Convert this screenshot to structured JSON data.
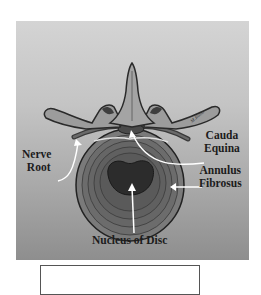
{
  "figure": {
    "type": "anatomical-diagram",
    "colors": {
      "background_top": "#d4d4d4",
      "background_bottom": "#8e8e8e",
      "bone": "#9a9a9a",
      "outline": "#2a2a2a",
      "disc_ring": "#6e6e6e",
      "nucleus": "#2e2e2e",
      "arrow": "#ffffff",
      "label_text": "#1c1c1c"
    },
    "labels": {
      "nerve_root": {
        "line1": "Nerve",
        "line2": "Root"
      },
      "cauda_equina": {
        "line1": "Cauda",
        "line2": "Equina"
      },
      "annulus_fibrosus": {
        "line1": "Annulus",
        "line2": "Fibrosus"
      },
      "nucleus": {
        "text": "Nucleus of Disc"
      }
    },
    "signature": "M.Rollo"
  },
  "caption_box": {
    "text": ""
  }
}
